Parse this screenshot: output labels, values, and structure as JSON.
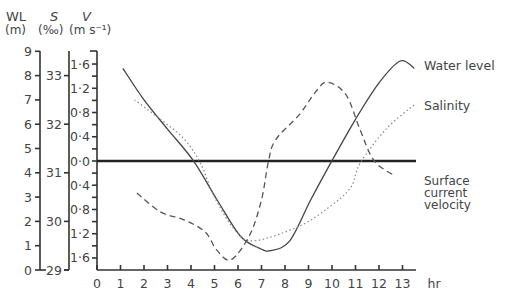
{
  "axes": {
    "wl": {
      "label": "WL",
      "unit": "(m)",
      "ticks": [
        "0",
        "1",
        "2",
        "3",
        "4",
        "5",
        "6",
        "7",
        "8",
        "9"
      ]
    },
    "s": {
      "label": "S",
      "unit": "(‰)",
      "ticks": [
        "29",
        "30",
        "31",
        "32",
        "33"
      ]
    },
    "v": {
      "label": "V",
      "unit": "(m s⁻¹)",
      "ticks_up": [
        "0·0",
        "0·4",
        "0·8",
        "1·2",
        "1·6"
      ],
      "ticks_down": [
        "0·4",
        "0·8",
        "1·2",
        "1·6"
      ]
    },
    "x": {
      "label": "hr",
      "ticks": [
        "0",
        "1",
        "2",
        "3",
        "4",
        "5",
        "6",
        "7",
        "8",
        "9",
        "10",
        "11",
        "12",
        "13"
      ]
    }
  },
  "legend": {
    "water_level": "Water level",
    "salinity": "Salinity",
    "velocity_line1": "Surface",
    "velocity_line2": "current",
    "velocity_line3": "velocity"
  },
  "chart_data": {
    "type": "line",
    "title": "",
    "xlabel": "hr",
    "ylabels": [
      "WL (m)",
      "S (‰)",
      "V (m s⁻¹)"
    ],
    "xlim": [
      0,
      13.5
    ],
    "ylim_wl": [
      0,
      9
    ],
    "ylim_s": [
      29,
      33.5
    ],
    "ylim_v": [
      -1.8,
      1.8
    ],
    "grid": false,
    "legend_position": "right, inline labels",
    "series": [
      {
        "name": "Water level",
        "style": "solid",
        "axis": "WL (m)",
        "x": [
          1.1,
          2.0,
          3.0,
          4.1,
          5.1,
          6.1,
          6.9,
          7.4,
          8.2,
          9.1,
          10.0,
          11.0,
          12.0,
          12.9,
          13.5
        ],
        "y": [
          8.3,
          7.0,
          5.8,
          4.5,
          2.9,
          1.4,
          0.9,
          0.8,
          1.2,
          2.9,
          4.5,
          6.2,
          7.7,
          8.6,
          8.3
        ]
      },
      {
        "name": "Salinity",
        "style": "dotted",
        "axis": "S (‰)",
        "x": [
          1.6,
          2.7,
          3.7,
          4.4,
          5.0,
          5.9,
          6.7,
          8.6,
          9.9,
          10.8,
          11.2,
          12.3,
          13.5
        ],
        "y": [
          32.5,
          32.1,
          31.7,
          31.2,
          30.5,
          29.8,
          29.6,
          29.9,
          30.3,
          30.7,
          31.2,
          31.9,
          32.4
        ]
      },
      {
        "name": "Surface current velocity",
        "style": "dashed",
        "axis": "V (m s⁻¹)",
        "x": [
          1.7,
          2.7,
          3.7,
          4.6,
          5.1,
          5.7,
          6.5,
          7.0,
          7.3,
          7.6,
          8.6,
          9.3,
          9.8,
          10.6,
          11.2,
          11.8,
          12.7
        ],
        "y": [
          -0.53,
          -0.84,
          -0.97,
          -1.17,
          -1.47,
          -1.63,
          -1.22,
          -0.64,
          0.0,
          0.35,
          0.76,
          1.14,
          1.3,
          1.09,
          0.51,
          0.0,
          -0.25
        ]
      }
    ],
    "reference_lines": [
      {
        "axis": "V (m s⁻¹)",
        "value": 0.0,
        "style": "thick solid"
      }
    ]
  }
}
